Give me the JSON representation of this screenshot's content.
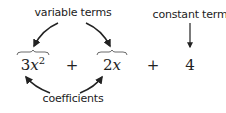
{
  "labels": {
    "variable_terms": "variable terms",
    "constant_term": "constant term",
    "coefficients": "coefficients"
  },
  "expression": {
    "term1": {
      "coefficient": "3",
      "variable": "x",
      "exponent": "2"
    },
    "op1": "+",
    "term2": {
      "coefficient": "2",
      "variable": "x"
    },
    "op2": "+",
    "term3": {
      "constant": "4"
    }
  },
  "colors": {
    "ink": "#222222",
    "background": "#ffffff"
  }
}
